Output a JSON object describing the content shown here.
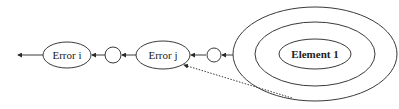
{
  "diagram": {
    "nodes": {
      "error_i": {
        "label": "Error i"
      },
      "circle_1": {
        "label": ""
      },
      "error_j": {
        "label": "Error j"
      },
      "circle_2": {
        "label": ""
      },
      "element_1": {
        "label": "Element 1"
      }
    },
    "edges": [
      {
        "from": "error_i",
        "to": "outside-left",
        "style": "solid"
      },
      {
        "from": "circle_1",
        "to": "error_i",
        "style": "solid"
      },
      {
        "from": "error_j",
        "to": "circle_1",
        "style": "solid"
      },
      {
        "from": "circle_2",
        "to": "error_j",
        "style": "solid"
      },
      {
        "from": "element_1-outer-ring",
        "to": "circle_2",
        "style": "solid"
      },
      {
        "from": "element_1-outer-ring",
        "to": "error_j",
        "style": "dotted"
      }
    ],
    "rings": [
      "outer-ring",
      "middle-ring",
      "inner-ring"
    ],
    "colors": {
      "stroke": "#3a3a3a",
      "background": "#ffffff",
      "text": "#222222"
    }
  }
}
